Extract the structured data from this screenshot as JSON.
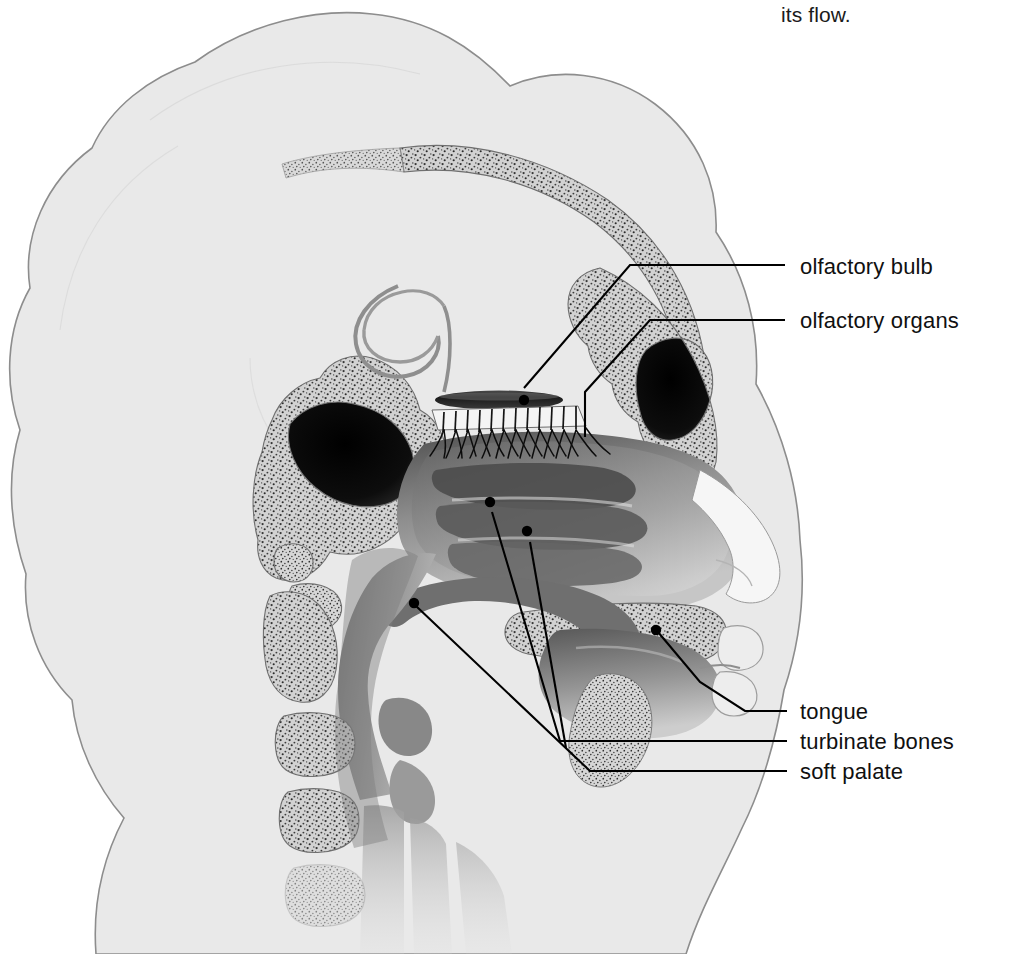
{
  "figure": {
    "kind": "anatomical-illustration",
    "view": "left lateral / sagittal cutaway",
    "caption_fragment": "its flow.",
    "colors": {
      "page_background": "#ffffff",
      "head_silhouette": "#e9e9e9",
      "head_outline": "#8d8d8d",
      "bone_stipple_fill": "#cfcfcf",
      "bone_stipple_dots": "#2f2f2f",
      "sinus_cavity_dark": "#101010",
      "soft_tissue_mid": "#8b8b8b",
      "soft_tissue_dark": "#5a5a5a",
      "airway_white": "#fbfbfb",
      "leader_line": "#000000",
      "label_text": "#101010"
    }
  },
  "labels": [
    {
      "id": "olfactory-bulb",
      "text": "olfactory bulb",
      "x": 800,
      "y": 256
    },
    {
      "id": "olfactory-organs",
      "text": "olfactory organs",
      "x": 800,
      "y": 310
    },
    {
      "id": "tongue",
      "text": "tongue",
      "x": 800,
      "y": 702
    },
    {
      "id": "turbinate-bones",
      "text": "turbinate bones",
      "x": 800,
      "y": 732
    },
    {
      "id": "soft-palate",
      "text": "soft palate",
      "x": 800,
      "y": 762
    }
  ],
  "leaders": [
    {
      "id": "leader-olfactory-bulb",
      "for": "olfactory bulb",
      "path": "M785,265 L630,265 L524,388",
      "dots": [
        {
          "cx": 524,
          "cy": 400
        }
      ]
    },
    {
      "id": "leader-olfactory-organs",
      "for": "olfactory organs",
      "path": "M785,320 L650,320 L585,392 L585,437",
      "dots": []
    },
    {
      "id": "leader-tongue",
      "for": "tongue",
      "path": "M787,711 L745,711 L700,682 L658,632",
      "dots": [
        {
          "cx": 656,
          "cy": 630
        }
      ]
    },
    {
      "id": "leader-turbinate-bones",
      "for": "turbinate bones",
      "path": "M787,741 L560,741 L492,512 M560,741 L530,542",
      "dots": [
        {
          "cx": 490,
          "cy": 502
        },
        {
          "cx": 527,
          "cy": 531
        }
      ]
    },
    {
      "id": "leader-soft-palate",
      "for": "soft palate",
      "path": "M787,771 L590,771 L416,606",
      "dots": [
        {
          "cx": 414,
          "cy": 603
        }
      ]
    }
  ],
  "anatomy_parts": [
    {
      "id": "head-silhouette",
      "name": "head and neck silhouette"
    },
    {
      "id": "cranial-vault",
      "name": "cranial vault bone band"
    },
    {
      "id": "frontal-sinus",
      "name": "frontal sinus cavity"
    },
    {
      "id": "sphenoid-sinus",
      "name": "sphenoid sinus cavity"
    },
    {
      "id": "olfactory-bulb",
      "name": "olfactory bulb"
    },
    {
      "id": "cribriform-plate",
      "name": "cribriform plate with olfactory nerve fibres"
    },
    {
      "id": "olfactory-organs",
      "name": "olfactory organs / nerve endings"
    },
    {
      "id": "nasal-cavity",
      "name": "nasal cavity with turbinates"
    },
    {
      "id": "superior-turbinate",
      "name": "superior turbinate bone"
    },
    {
      "id": "middle-turbinate",
      "name": "middle turbinate bone"
    },
    {
      "id": "inferior-turbinate",
      "name": "inferior turbinate bone"
    },
    {
      "id": "hard-palate",
      "name": "hard palate"
    },
    {
      "id": "soft-palate",
      "name": "soft palate"
    },
    {
      "id": "tongue",
      "name": "tongue"
    },
    {
      "id": "uvula",
      "name": "uvula"
    },
    {
      "id": "nasopharynx",
      "name": "nasopharynx / oropharynx airway"
    },
    {
      "id": "epiglottis",
      "name": "epiglottis"
    },
    {
      "id": "larynx-trachea",
      "name": "larynx and trachea"
    },
    {
      "id": "cervical-vertebrae",
      "name": "cervical vertebrae"
    },
    {
      "id": "lips",
      "name": "lips"
    },
    {
      "id": "nose-profile",
      "name": "external nose profile"
    }
  ]
}
